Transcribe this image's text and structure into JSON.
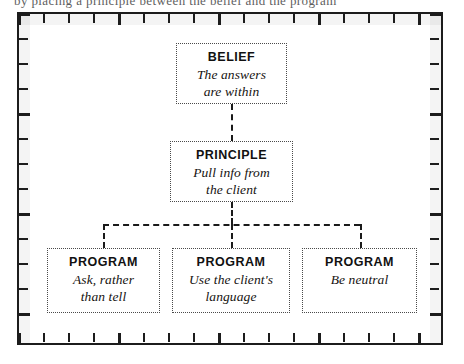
{
  "page": {
    "cropped_caption_top": "by placing a principle between the belief and the program",
    "background_color": "#ffffff",
    "ink_color": "#1c1c1c"
  },
  "frame": {
    "style": "ruler-border",
    "tick_spacing_px": 25,
    "top_tick_count": 17,
    "bottom_tick_count": 17,
    "left_tick_count": 13,
    "right_tick_count": 13
  },
  "diagram": {
    "type": "hierarchy",
    "levels": [
      "BELIEF",
      "PRINCIPLE",
      "PROGRAM"
    ],
    "connector_style": "dashed",
    "belief": {
      "title": "BELIEF",
      "lines": [
        "The answers",
        "are within"
      ]
    },
    "principle": {
      "title": "PRINCIPLE",
      "lines": [
        "Pull info from",
        "the client"
      ]
    },
    "programs": [
      {
        "title": "PROGRAM",
        "lines": [
          "Ask, rather",
          "than tell"
        ]
      },
      {
        "title": "PROGRAM",
        "lines": [
          "Use the client's",
          "language"
        ]
      },
      {
        "title": "PROGRAM",
        "lines": [
          "Be neutral"
        ]
      }
    ]
  }
}
